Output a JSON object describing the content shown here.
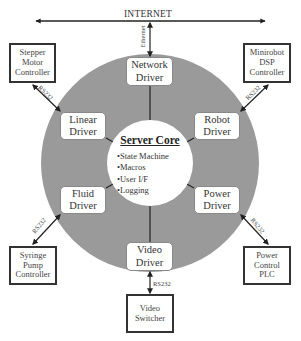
{
  "network": {
    "backbone_label": "INTERNET",
    "ethernet_label": "Ethernet"
  },
  "core": {
    "title": "Server Core",
    "features": [
      "State Machine",
      "Macros",
      "User I/F",
      "Logging"
    ]
  },
  "drivers": {
    "network": {
      "line1": "Network",
      "line2": "Driver"
    },
    "linear": {
      "line1": "Linear",
      "line2": "Driver"
    },
    "robot": {
      "line1": "Robot",
      "line2": "Driver"
    },
    "fluid": {
      "line1": "Fluid",
      "line2": "Driver"
    },
    "power": {
      "line1": "Power",
      "line2": "Driver"
    },
    "video": {
      "line1": "Video",
      "line2": "Driver"
    }
  },
  "devices": {
    "stepper": {
      "line1": "Stepper",
      "line2": "Motor",
      "line3": "Controller",
      "link": "RS232"
    },
    "minirobot": {
      "line1": "Minirobot",
      "line2": "DSP",
      "line3": "Controller",
      "link": "RS232"
    },
    "syringe": {
      "line1": "Syringe",
      "line2": "Pump",
      "line3": "Controller",
      "link": "RS232"
    },
    "power_plc": {
      "line1": "Power",
      "line2": "Control",
      "line3": "PLC",
      "link": "RS232"
    },
    "video_switcher": {
      "line1": "Video",
      "line2": "Switcher",
      "link": "RS232"
    }
  },
  "colors": {
    "ring_fill": "#9a9a9a",
    "core_fill": "#ffffff",
    "line": "#222222"
  }
}
